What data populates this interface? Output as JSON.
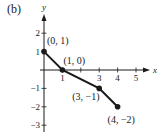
{
  "panel_label": "(b)",
  "chart_data": {
    "type": "line",
    "title": "",
    "xlabel": "x",
    "ylabel": "y",
    "xlim": [
      0,
      5
    ],
    "ylim": [
      -3,
      2
    ],
    "x_ticks": [
      1,
      2,
      3,
      4,
      5
    ],
    "x_tick_labels": [
      "1",
      "",
      "3",
      "4",
      "5"
    ],
    "y_ticks": [
      2,
      1,
      -1,
      -2,
      -3
    ],
    "y_tick_labels": [
      "2",
      "1",
      "-1",
      "-2",
      "-3"
    ],
    "grid": false,
    "series": [
      {
        "name": "piecewise",
        "x": [
          0,
          1,
          3,
          4
        ],
        "y": [
          1,
          0,
          -1,
          -2
        ],
        "markers": true
      }
    ],
    "annotations": [
      {
        "text": "(0, 1)",
        "x": 0,
        "y": 1
      },
      {
        "text": "(1, 0)",
        "x": 1,
        "y": 0
      },
      {
        "text": "(3, −1)",
        "x": 3,
        "y": -1
      },
      {
        "text": "(4, −2)",
        "x": 4,
        "y": -2
      }
    ]
  },
  "layout": {
    "origin_px": [
      44,
      70
    ],
    "unit_px": 18.4,
    "x_axis_px": [
      40,
      150
    ],
    "y_axis_px": [
      132,
      14
    ],
    "ann_offsets": [
      [
        3,
        -8
      ],
      [
        1,
        -6
      ],
      [
        -27,
        12
      ],
      [
        -10,
        16
      ]
    ]
  }
}
